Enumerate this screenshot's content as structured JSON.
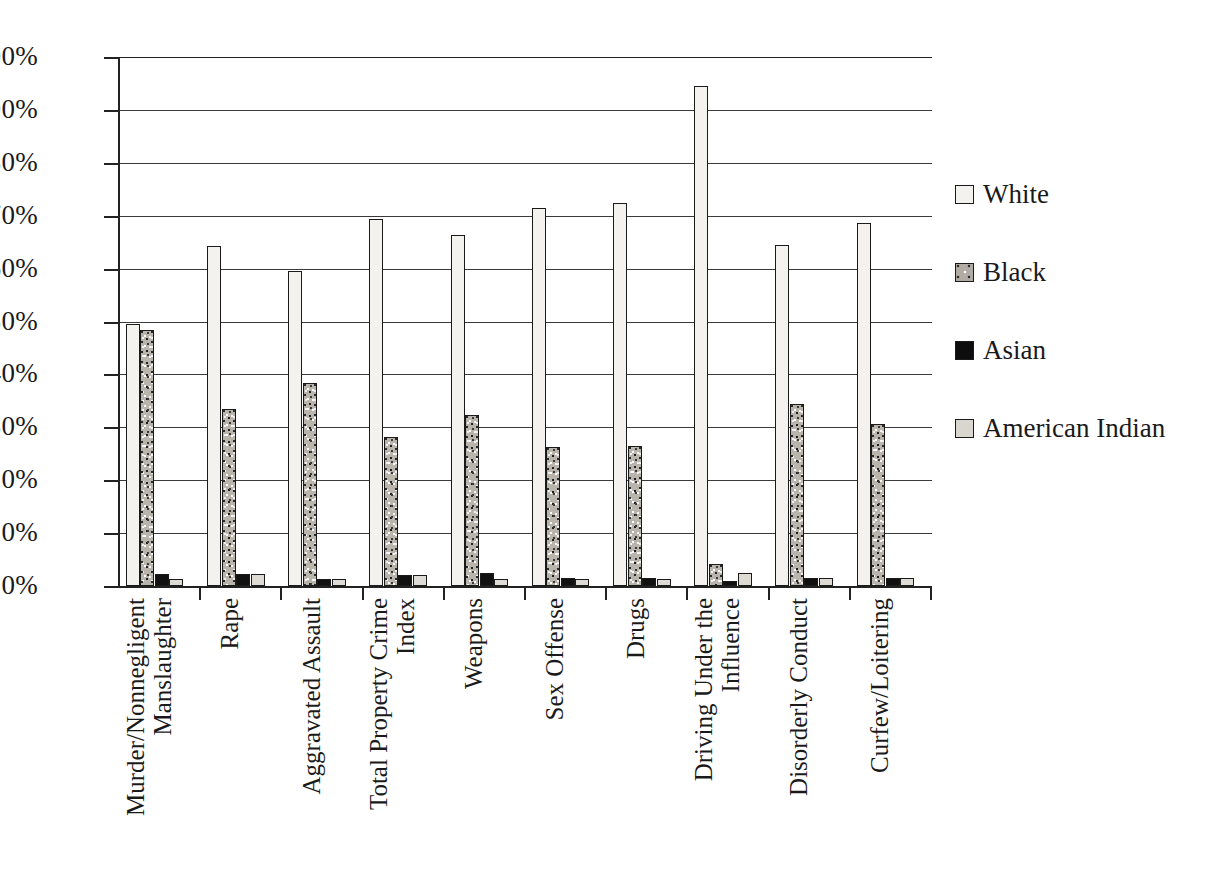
{
  "chart_data": {
    "type": "bar",
    "title": "",
    "subtitle": "",
    "xlabel": "",
    "ylabel": "",
    "ylim": [
      0,
      100
    ],
    "y_unit": "%",
    "grid": true,
    "legend_position": "right",
    "orientation": "vertical",
    "grouping": "clustered",
    "y_ticks": [
      "0%",
      "10%",
      "20%",
      "30%",
      "40%",
      "50%",
      "60%",
      "70%",
      "80%",
      "90%",
      "100%"
    ],
    "y_tick_values": [
      0,
      10,
      20,
      30,
      40,
      50,
      60,
      70,
      80,
      90,
      100
    ],
    "categories": [
      "Murder/Nonnegligent Manslaughter",
      "Rape",
      "Aggravated Assault",
      "Total Property Crime Index",
      "Weapons",
      "Sex Offense",
      "Drugs",
      "Driving Under the Influence",
      "Disorderly Conduct",
      "Curfew/Loitering"
    ],
    "category_lines": [
      [
        "Murder/Nonnegligent",
        "Manslaughter"
      ],
      [
        "Rape"
      ],
      [
        "Aggravated Assault"
      ],
      [
        "Total Property Crime",
        "Index"
      ],
      [
        "Weapons"
      ],
      [
        "Sex Offense"
      ],
      [
        "Drugs"
      ],
      [
        "Driving Under the",
        "Influence"
      ],
      [
        "Disorderly Conduct"
      ],
      [
        "Curfew/Loitering"
      ]
    ],
    "series": [
      {
        "name": "White",
        "pattern": "open-light",
        "color": "#f4f2ee",
        "values": [
          49.5,
          64.3,
          59.6,
          69.4,
          66.3,
          71.5,
          72.4,
          94.5,
          64.5,
          68.7
        ]
      },
      {
        "name": "Black",
        "pattern": "speckled",
        "color": "#b9b4ac",
        "values": [
          48.4,
          33.4,
          38.3,
          28.2,
          32.3,
          26.2,
          26.4,
          4.2,
          34.4,
          30.6
        ]
      },
      {
        "name": "Asian",
        "pattern": "solid-black",
        "color": "#111111",
        "values": [
          2.3,
          2.2,
          1.4,
          2.0,
          2.4,
          1.5,
          1.5,
          1.0,
          1.5,
          1.5
        ]
      },
      {
        "name": "American Indian",
        "pattern": "light-gray",
        "color": "#dedbd4",
        "values": [
          1.4,
          2.2,
          1.4,
          2.1,
          1.4,
          1.4,
          1.4,
          2.5,
          1.5,
          1.5
        ]
      }
    ]
  },
  "legend": {
    "items": [
      {
        "label": "White"
      },
      {
        "label": "Black"
      },
      {
        "label": "Asian"
      },
      {
        "label": "American Indian"
      }
    ]
  }
}
